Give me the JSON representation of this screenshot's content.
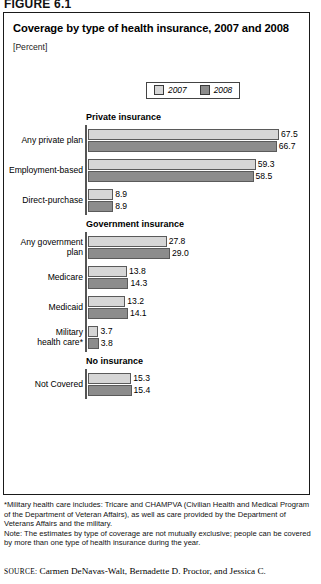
{
  "figure_label": "FIGURE 6.1",
  "title": "Coverage by type of health insurance, 2007 and 2008",
  "units": "[Percent]",
  "legend": [
    {
      "label": "2007",
      "color": "#d6d6d6"
    },
    {
      "label": "2008",
      "color": "#8c8c8c"
    }
  ],
  "notes": {
    "footnote": "*Military health care includes: Tricare and CHAMPVA (Civilian Health and Medical Program of the Department of Veteran Affairs), as well as care provided by the Department of Veterans Affairs and the military.",
    "note": "Note: The estimates by type of coverage are not mutually exclusive; people can be covered by more than one type of health insurance during the year."
  },
  "source": {
    "label": "SOURCE:",
    "text": "Carmen DeNavas-Walt, Bernadette D. Proctor, and Jessica C."
  },
  "chart_data": {
    "type": "bar",
    "orientation": "horizontal",
    "title": "Coverage by type of health insurance, 2007 and 2008",
    "xlabel": "",
    "ylabel": "",
    "unit": "Percent",
    "xlim": [
      0,
      70
    ],
    "grid": false,
    "legend_position": "top-center",
    "series": [
      {
        "name": "2007",
        "color": "#d6d6d6"
      },
      {
        "name": "2008",
        "color": "#8c8c8c"
      }
    ],
    "groups": [
      {
        "header": "Private insurance",
        "rows": [
          {
            "category": "Any private plan",
            "values": [
              67.5,
              66.7
            ],
            "labels": [
              "67.5",
              "66.7"
            ]
          },
          {
            "category": "Employment-based",
            "values": [
              59.3,
              58.5
            ],
            "labels": [
              "59.3",
              "58.5"
            ]
          },
          {
            "category": "Direct-purchase",
            "values": [
              8.9,
              8.9
            ],
            "labels": [
              "8.9",
              "8.9"
            ]
          }
        ]
      },
      {
        "header": "Government insurance",
        "rows": [
          {
            "category": "Any government\nplan",
            "values": [
              27.8,
              29.0
            ],
            "labels": [
              "27.8",
              "29.0"
            ]
          },
          {
            "category": "Medicare",
            "values": [
              13.8,
              14.3
            ],
            "labels": [
              "13.8",
              "14.3"
            ]
          },
          {
            "category": "Medicaid",
            "values": [
              13.2,
              14.1
            ],
            "labels": [
              "13.2",
              "14.1"
            ]
          },
          {
            "category": "Military\nhealth care*",
            "values": [
              3.7,
              3.8
            ],
            "labels": [
              "3.7",
              "3.8"
            ]
          }
        ]
      },
      {
        "header": "No insurance",
        "rows": [
          {
            "category": "Not Covered",
            "values": [
              15.3,
              15.4
            ],
            "labels": [
              "15.3",
              "15.4"
            ]
          }
        ]
      }
    ]
  }
}
